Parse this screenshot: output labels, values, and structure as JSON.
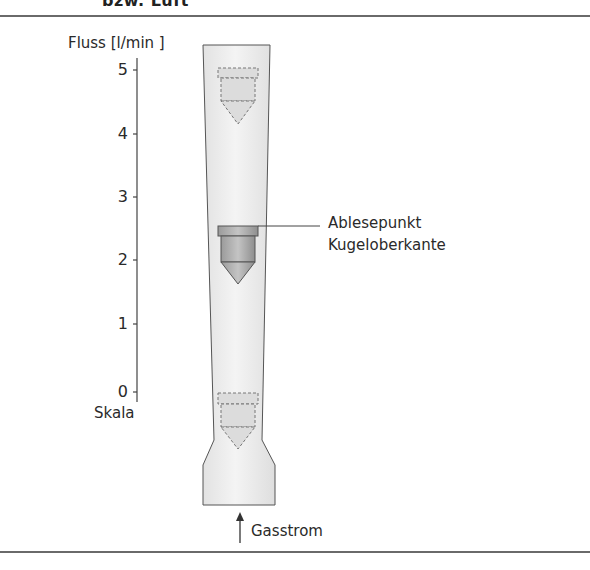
{
  "heading": {
    "text": "bzw. Luft"
  },
  "scale": {
    "title": "Fluss [l/min ]",
    "caption": "Skala",
    "ticks": [
      {
        "value": "5",
        "y": 70
      },
      {
        "value": "4",
        "y": 134
      },
      {
        "value": "3",
        "y": 197
      },
      {
        "value": "2",
        "y": 260
      },
      {
        "value": "1",
        "y": 324
      },
      {
        "value": "0",
        "y": 392
      }
    ]
  },
  "labels": {
    "reading_point_line1": "Ablesepunkt",
    "reading_point_line2": "Kugeloberkante",
    "gas_flow": "Gasstrom"
  },
  "colors": {
    "tube_fill": "#ececec",
    "tube_stroke": "#555555",
    "float_fill": "#a8a8a8",
    "float_stroke": "#555555",
    "dashed": "#777777",
    "rule": "#6a6a6a"
  }
}
